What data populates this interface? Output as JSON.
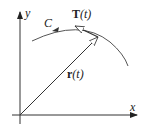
{
  "diagram": {
    "type": "vector-function-tangent",
    "labels": {
      "y_axis": "y",
      "x_axis": "x",
      "curve": "C",
      "tangent_bold": "T",
      "tangent_arg": "(t)",
      "position_bold": "r",
      "position_arg": "(t)"
    },
    "colors": {
      "stroke": "#333333",
      "background": "#ffffff"
    }
  }
}
